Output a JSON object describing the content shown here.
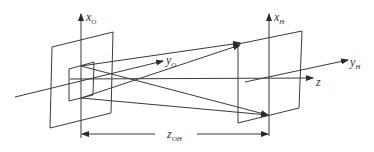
{
  "figure": {
    "type": "optical-geometry-diagram",
    "labels": {
      "object_x_axis": {
        "main": "x",
        "sub": "O"
      },
      "object_y_axis": {
        "main": "y",
        "sub": "O"
      },
      "holo_x_axis": {
        "main": "x",
        "sub": "H"
      },
      "holo_y_axis": {
        "main": "y",
        "sub": "H"
      },
      "z_axis": {
        "main": "z",
        "sub": ""
      },
      "distance": {
        "main": "z",
        "sub": "OH"
      }
    },
    "colors": {
      "line": "#3a3a3a",
      "background": "#ffffff"
    }
  }
}
